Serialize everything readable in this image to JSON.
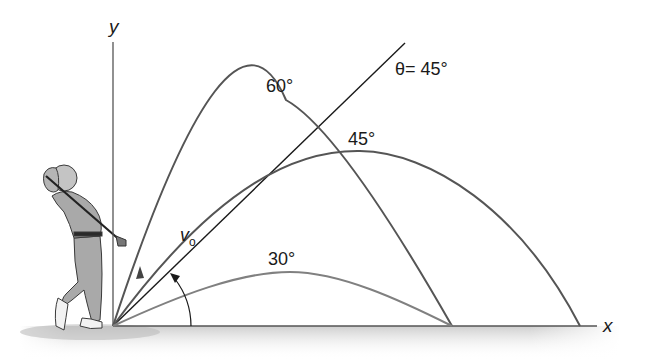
{
  "figure": {
    "axes": {
      "x_label": "x",
      "y_label": "y"
    },
    "launch_line_label": "θ= 45°",
    "velocity_label": "v",
    "velocity_subscript": "o",
    "trajectories": [
      {
        "angle_label": "60°",
        "color": "#555555"
      },
      {
        "angle_label": "45°",
        "color": "#555555"
      },
      {
        "angle_label": "30°",
        "color": "#777777"
      }
    ],
    "colors": {
      "axis": "#555555",
      "launch_line": "#1a1a1a",
      "ground_shadow": "#cfcfcf",
      "golfer_fill": "#a9a9a9",
      "golfer_outline": "#3a3a3a"
    }
  }
}
